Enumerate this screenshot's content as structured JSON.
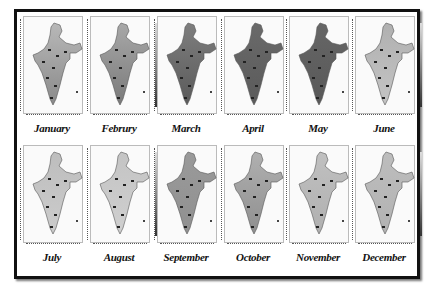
{
  "figure": {
    "panels": [
      {
        "month": "January",
        "shade": "#b8b8b8",
        "south": "#8a8a8a"
      },
      {
        "month": "Februry",
        "shade": "#a8a8a8",
        "south": "#7a7a7a"
      },
      {
        "month": "March",
        "shade": "#7e7e7e",
        "south": "#5a5a5a"
      },
      {
        "month": "April",
        "shade": "#6a6a6a",
        "south": "#5a5a5a"
      },
      {
        "month": "May",
        "shade": "#666666",
        "south": "#585858"
      },
      {
        "month": "June",
        "shade": "#b0b0b0",
        "south": "#c4c4c4"
      },
      {
        "month": "July",
        "shade": "#bdbdbd",
        "south": "#cccccc"
      },
      {
        "month": "August",
        "shade": "#c4c4c4",
        "south": "#cfcfcf"
      },
      {
        "month": "September",
        "shade": "#9a9a9a",
        "south": "#909090"
      },
      {
        "month": "October",
        "shade": "#b0b0b0",
        "south": "#8f8f8f"
      },
      {
        "month": "November",
        "shade": "#c0c0c0",
        "south": "#b0b0b0"
      },
      {
        "month": "December",
        "shade": "#bdbdbd",
        "south": "#b2b2b2"
      }
    ]
  }
}
